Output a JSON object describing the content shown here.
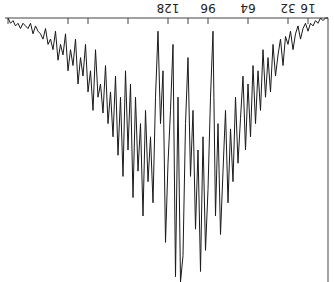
{
  "chart_data": {
    "type": "line",
    "title": "",
    "xlabel": "",
    "ylabel": "",
    "orientation": "rotated 180 degrees (upside-down)",
    "x_tick_labels": [
      "16",
      "32",
      "64",
      "96",
      "128"
    ],
    "x_ticks": [
      16,
      32,
      64,
      96,
      112,
      128,
      160,
      192,
      208,
      256
    ],
    "xlim": [
      0,
      260
    ],
    "ylim": [
      0,
      1
    ],
    "grid": false,
    "legend": null,
    "stroke_color": "#1a1a1a",
    "frame_color": "#444444",
    "x": [
      2,
      4,
      6,
      8,
      10,
      12,
      14,
      16,
      18,
      20,
      22,
      24,
      26,
      28,
      30,
      32,
      34,
      36,
      38,
      40,
      42,
      44,
      46,
      48,
      50,
      52,
      54,
      56,
      58,
      60,
      62,
      64,
      66,
      68,
      70,
      72,
      74,
      76,
      78,
      80,
      82,
      84,
      86,
      88,
      90,
      92,
      94,
      96,
      98,
      100,
      102,
      104,
      106,
      108,
      110,
      112,
      114,
      116,
      118,
      120,
      122,
      124,
      126,
      128,
      130,
      132,
      134,
      136,
      138,
      140,
      142,
      144,
      146,
      148,
      150,
      152,
      154,
      156,
      158,
      160,
      162,
      164,
      166,
      168,
      170,
      172,
      174,
      176,
      178,
      180,
      182,
      184,
      186,
      188,
      190,
      192,
      194,
      196,
      198,
      200,
      202,
      204,
      206,
      208,
      210,
      212,
      214,
      216,
      218,
      220,
      222,
      224,
      226,
      228,
      230,
      232,
      234,
      236,
      238,
      240,
      242,
      244,
      246,
      248,
      250,
      252,
      254,
      256
    ],
    "values": [
      0.0,
      0.01,
      0.0,
      0.02,
      0.01,
      0.03,
      0.02,
      0.05,
      0.02,
      0.04,
      0.08,
      0.03,
      0.06,
      0.12,
      0.05,
      0.1,
      0.07,
      0.18,
      0.08,
      0.14,
      0.22,
      0.1,
      0.28,
      0.15,
      0.3,
      0.12,
      0.35,
      0.2,
      0.4,
      0.18,
      0.45,
      0.25,
      0.5,
      0.22,
      0.38,
      0.55,
      0.3,
      0.62,
      0.42,
      0.7,
      0.35,
      0.58,
      0.82,
      0.4,
      0.75,
      0.05,
      0.3,
      0.65,
      0.88,
      0.45,
      0.96,
      0.5,
      0.8,
      0.35,
      0.6,
      0.15,
      0.4,
      0.9,
      1.0,
      0.3,
      0.98,
      0.1,
      0.35,
      0.55,
      0.85,
      0.2,
      0.4,
      0.05,
      0.3,
      0.7,
      0.45,
      0.62,
      0.35,
      0.75,
      0.4,
      0.58,
      0.3,
      0.68,
      0.25,
      0.5,
      0.2,
      0.6,
      0.3,
      0.52,
      0.22,
      0.45,
      0.28,
      0.4,
      0.18,
      0.36,
      0.25,
      0.3,
      0.12,
      0.35,
      0.2,
      0.28,
      0.1,
      0.22,
      0.15,
      0.25,
      0.08,
      0.18,
      0.12,
      0.2,
      0.06,
      0.14,
      0.1,
      0.16,
      0.05,
      0.12,
      0.08,
      0.1,
      0.04,
      0.08,
      0.06,
      0.05,
      0.03,
      0.06,
      0.02,
      0.04,
      0.03,
      0.02,
      0.04,
      0.02,
      0.03,
      0.01,
      0.02,
      0.0
    ]
  }
}
